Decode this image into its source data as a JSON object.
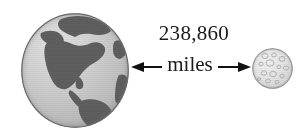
{
  "figure": {
    "name": "earth-moon-distance-diagram",
    "background_color": "#ffffff"
  },
  "earth": {
    "label": "Earth",
    "ocean_color": "#c9c9c9",
    "land_color": "#5f5f5f",
    "outline_color": "#6e6e6e"
  },
  "moon": {
    "label": "Moon",
    "surface_color": "#e6e6e6",
    "crater_color": "#b9b9b9",
    "outline_color": "#9a9a9a"
  },
  "measurement": {
    "value": "238,860",
    "unit": "miles",
    "arrow_color": "#111111",
    "arrow_style": "double-headed"
  }
}
